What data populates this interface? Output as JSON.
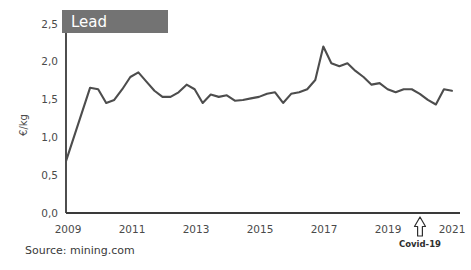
{
  "figure": {
    "background_color": "#ffffff",
    "source_note": "Source: mining.com"
  },
  "title_box": {
    "label": "Lead",
    "fill_color": "#737373",
    "text_color": "#ffffff"
  },
  "annotation": {
    "covid_label": "Covid-19",
    "arrow_name": "up-arrow-outline"
  },
  "chart_data": {
    "type": "line",
    "title": "Lead",
    "xlabel": "",
    "ylabel": "€/kg",
    "unit": "€/kg",
    "line_color": "#4d4d4d",
    "grid": false,
    "legend": "none",
    "xlim": [
      2009,
      2021.25
    ],
    "ylim": [
      0.0,
      2.5
    ],
    "xticks": [
      2009,
      2011,
      2013,
      2015,
      2017,
      2019,
      2021
    ],
    "xticklabels": [
      "2009",
      "2011",
      "2013",
      "2015",
      "2017",
      "2019",
      "2021"
    ],
    "yticks": [
      0.0,
      0.5,
      1.0,
      1.5,
      2.0,
      2.5
    ],
    "yticklabels": [
      "0,0",
      "0,5",
      "1,0",
      "1,5",
      "2,0",
      "2,5"
    ],
    "decimal_separator": "comma",
    "annotations": [
      {
        "text": "Covid-19",
        "x": 2020.1,
        "y": 0.0,
        "marker": "up-arrow"
      }
    ],
    "series": [
      {
        "name": "Lead",
        "color": "#4d4d4d",
        "x": [
          2009.0,
          2009.75,
          2010.0,
          2010.25,
          2010.5,
          2010.75,
          2011.0,
          2011.25,
          2011.5,
          2011.75,
          2012.0,
          2012.25,
          2012.5,
          2012.75,
          2013.0,
          2013.25,
          2013.5,
          2013.75,
          2014.0,
          2014.25,
          2014.5,
          2014.75,
          2015.0,
          2015.25,
          2015.5,
          2015.75,
          2016.0,
          2016.25,
          2016.5,
          2016.75,
          2017.0,
          2017.25,
          2017.5,
          2017.75,
          2018.0,
          2018.25,
          2018.5,
          2018.75,
          2019.0,
          2019.25,
          2019.5,
          2019.75,
          2020.0,
          2020.25,
          2020.5,
          2020.75,
          2021.0
        ],
        "y": [
          0.68,
          1.64,
          1.62,
          1.44,
          1.48,
          1.62,
          1.78,
          1.84,
          1.72,
          1.6,
          1.52,
          1.52,
          1.58,
          1.68,
          1.62,
          1.44,
          1.55,
          1.52,
          1.54,
          1.47,
          1.48,
          1.5,
          1.52,
          1.56,
          1.58,
          1.44,
          1.56,
          1.58,
          1.62,
          1.74,
          2.18,
          1.96,
          1.92,
          1.96,
          1.86,
          1.78,
          1.68,
          1.7,
          1.62,
          1.58,
          1.62,
          1.62,
          1.56,
          1.48,
          1.42,
          1.62,
          1.6
        ]
      }
    ]
  }
}
